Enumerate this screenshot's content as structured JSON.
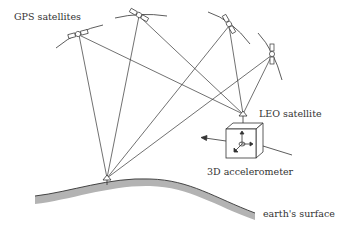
{
  "diagram": {
    "labels": {
      "gps": "GPS satellites",
      "leo": "LEO satellite",
      "accelerometer": "3D accelerometer",
      "surface": "earth's surface"
    },
    "colors": {
      "line": "#333333",
      "surface_fill": "#b3b3b3",
      "background": "#ffffff"
    },
    "gps_satellites": [
      {
        "id": "gps-1",
        "x": 78,
        "y": 34
      },
      {
        "id": "gps-2",
        "x": 139,
        "y": 15
      },
      {
        "id": "gps-3",
        "x": 229,
        "y": 24
      },
      {
        "id": "gps-4",
        "x": 272,
        "y": 54
      }
    ],
    "leo_satellite": {
      "x": 243,
      "y": 114
    },
    "ground_station": {
      "x": 107,
      "y": 180
    }
  }
}
